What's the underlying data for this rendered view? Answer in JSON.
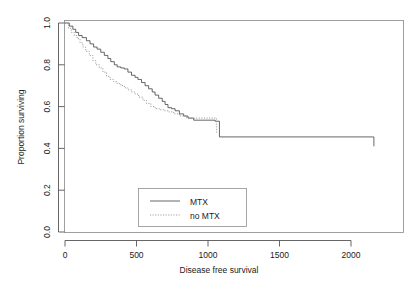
{
  "chart_data": {
    "type": "line",
    "title": "",
    "subtitle": "",
    "xlabel": "Disease free survival",
    "ylabel": "Proportion surviving",
    "xlim": [
      0,
      2200
    ],
    "ylim": [
      0.0,
      1.0
    ],
    "grid": false,
    "legend_position": "bottom-center",
    "xticks": [
      0,
      500,
      1000,
      1500,
      2000
    ],
    "xticklabels": [
      "0",
      "500",
      "1000",
      "1500",
      "2000"
    ],
    "yticks": [
      0.0,
      0.2,
      0.4,
      0.6,
      0.8,
      1.0
    ],
    "yticklabels": [
      "0.0",
      "0.2",
      "0.4",
      "0.6",
      "0.8",
      "1.0"
    ],
    "series": [
      {
        "name": "MTX",
        "style": "solid",
        "color": "#4d4d4d",
        "step": "post",
        "x": [
          0,
          30,
          55,
          75,
          95,
          120,
          150,
          175,
          200,
          225,
          250,
          275,
          300,
          320,
          345,
          365,
          390,
          415,
          440,
          465,
          490,
          510,
          535,
          560,
          585,
          610,
          630,
          655,
          680,
          700,
          720,
          745,
          770,
          800,
          830,
          860,
          900,
          1050,
          1080,
          2150,
          2160
        ],
        "y": [
          1.0,
          0.985,
          0.97,
          0.955,
          0.94,
          0.93,
          0.915,
          0.9,
          0.885,
          0.875,
          0.86,
          0.845,
          0.83,
          0.815,
          0.8,
          0.79,
          0.785,
          0.78,
          0.765,
          0.75,
          0.74,
          0.73,
          0.715,
          0.7,
          0.685,
          0.67,
          0.655,
          0.64,
          0.625,
          0.61,
          0.595,
          0.59,
          0.58,
          0.565,
          0.555,
          0.545,
          0.535,
          0.53,
          0.455,
          0.455,
          0.41
        ]
      },
      {
        "name": "no MTX",
        "style": "dotted",
        "color": "#8a8a8a",
        "step": "post",
        "x": [
          0,
          25,
          45,
          65,
          85,
          105,
          125,
          145,
          170,
          195,
          215,
          240,
          265,
          290,
          315,
          340,
          365,
          390,
          415,
          440,
          465,
          490,
          515,
          545,
          570,
          600,
          630,
          660,
          690,
          720,
          760,
          800,
          850,
          1040,
          1060
        ],
        "y": [
          1.0,
          0.975,
          0.955,
          0.94,
          0.925,
          0.905,
          0.885,
          0.865,
          0.845,
          0.82,
          0.8,
          0.785,
          0.765,
          0.745,
          0.73,
          0.72,
          0.71,
          0.7,
          0.69,
          0.68,
          0.67,
          0.66,
          0.645,
          0.63,
          0.615,
          0.6,
          0.59,
          0.585,
          0.58,
          0.575,
          0.565,
          0.555,
          0.545,
          0.545,
          0.47
        ]
      }
    ],
    "legend": [
      {
        "label": "MTX",
        "style": "solid"
      },
      {
        "label": "no MTX",
        "style": "dotted"
      }
    ]
  },
  "colors": {
    "background": "#ffffff",
    "frame": "#888888",
    "axis": "#555555",
    "series_solid": "#4d4d4d",
    "series_dotted": "#8a8a8a",
    "text": "#1a1a1a"
  }
}
